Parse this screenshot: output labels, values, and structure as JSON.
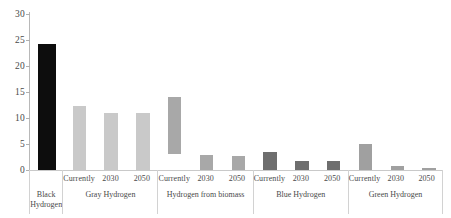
{
  "chart_data": {
    "type": "bar",
    "title": "",
    "subtitle": "",
    "xlabel": "",
    "ylabel": "",
    "ylim": [
      0,
      30
    ],
    "yticks": [
      0,
      5,
      10,
      15,
      20,
      25,
      30
    ],
    "ytick_labels": [
      "0",
      "5",
      "10",
      "15",
      "20",
      "25",
      "30"
    ],
    "grid": false,
    "legend": "none",
    "categories": [
      "Black Hydrogen",
      "Gray Hydrogen – Currently",
      "Gray Hydrogen – 2030",
      "Gray Hydrogen – 2050",
      "Hydrogen from biomass – Currently",
      "Hydrogen from biomass – 2030",
      "Hydrogen from biomass – 2050",
      "Blue Hydrogen – Currently",
      "Blue Hydrogen – 2030",
      "Blue Hydrogen – 2050",
      "Green Hydrogen – Currently",
      "Green Hydrogen – 2030",
      "Green Hydrogen – 2050"
    ],
    "values": [
      24.3,
      12.3,
      11.0,
      10.9,
      14.0,
      2.9,
      2.6,
      3.4,
      1.8,
      1.7,
      5.0,
      0.7,
      0.3
    ],
    "bar_bases": [
      0,
      0,
      0,
      0,
      3.0,
      0,
      0,
      0,
      0,
      0,
      0,
      0,
      0
    ],
    "note": "The 'Hydrogen from biomass – Currently' bar is a floating range bar spanning roughly 3 to 14 on the value axis."
  },
  "groups": [
    {
      "id": "black-hydrogen",
      "label": "Black Hydrogen",
      "label_lines": [
        "Black",
        "Hydrogen"
      ],
      "color": "#0d0d0d",
      "has_sub_labels": false,
      "bars": [
        {
          "sub_label": "",
          "value": 24.3,
          "base": 0
        }
      ]
    },
    {
      "id": "gray-hydrogen",
      "label": "Gray Hydrogen",
      "label_lines": [
        "Gray Hydrogen"
      ],
      "color": "#c9c9c9",
      "has_sub_labels": true,
      "bars": [
        {
          "sub_label": "Currently",
          "value": 12.3,
          "base": 0
        },
        {
          "sub_label": "2030",
          "value": 11.0,
          "base": 0
        },
        {
          "sub_label": "2050",
          "value": 10.9,
          "base": 0
        }
      ]
    },
    {
      "id": "hydrogen-from-biomass",
      "label": "Hydrogen from biomass",
      "label_lines": [
        "Hydrogen from biomass"
      ],
      "color": "#a8a8a8",
      "has_sub_labels": true,
      "bars": [
        {
          "sub_label": "Currently",
          "value": 14.0,
          "base": 3.0
        },
        {
          "sub_label": "2030",
          "value": 2.9,
          "base": 0
        },
        {
          "sub_label": "2050",
          "value": 2.6,
          "base": 0
        }
      ]
    },
    {
      "id": "blue-hydrogen",
      "label": "Blue Hydrogen",
      "label_lines": [
        "Blue Hydrogen"
      ],
      "color": "#6e6e6e",
      "has_sub_labels": true,
      "bars": [
        {
          "sub_label": "Currently",
          "value": 3.4,
          "base": 0
        },
        {
          "sub_label": "2030",
          "value": 1.8,
          "base": 0
        },
        {
          "sub_label": "2050",
          "value": 1.7,
          "base": 0
        }
      ]
    },
    {
      "id": "green-hydrogen",
      "label": "Green Hydrogen",
      "label_lines": [
        "Green Hydrogen"
      ],
      "color": "#a0a0a0",
      "has_sub_labels": true,
      "bars": [
        {
          "sub_label": "Currently",
          "value": 5.0,
          "base": 0
        },
        {
          "sub_label": "2030",
          "value": 0.7,
          "base": 0
        },
        {
          "sub_label": "2050",
          "value": 0.3,
          "base": 0
        }
      ]
    }
  ],
  "axis": {
    "line_color": "#b8b8b8",
    "tick_color": "#b0b0b0",
    "label_color": "#4a4a4a"
  }
}
